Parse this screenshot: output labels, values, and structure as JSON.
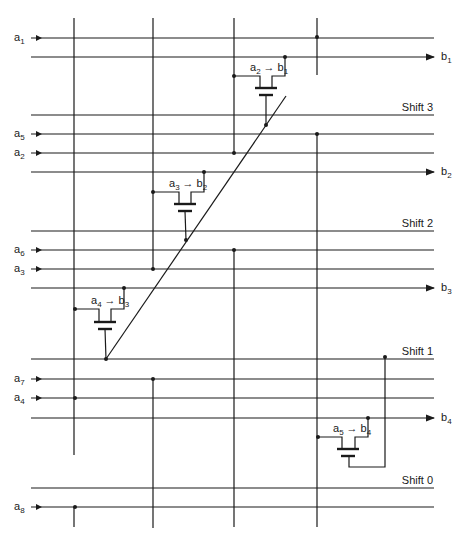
{
  "diagram": {
    "type": "barrel-shifter-crossbar",
    "inputs": [
      {
        "name": "a",
        "sub": "1",
        "y": 38
      },
      {
        "name": "a",
        "sub": "5",
        "y": 134
      },
      {
        "name": "a",
        "sub": "2",
        "y": 153
      },
      {
        "name": "a",
        "sub": "6",
        "y": 250
      },
      {
        "name": "a",
        "sub": "3",
        "y": 269
      },
      {
        "name": "a",
        "sub": "7",
        "y": 379
      },
      {
        "name": "a",
        "sub": "4",
        "y": 398
      },
      {
        "name": "a",
        "sub": "8",
        "y": 507
      }
    ],
    "outputs": [
      {
        "name": "b",
        "sub": "1",
        "y": 57
      },
      {
        "name": "b",
        "sub": "2",
        "y": 172
      },
      {
        "name": "b",
        "sub": "3",
        "y": 288
      },
      {
        "name": "b",
        "sub": "4",
        "y": 418
      }
    ],
    "shift_lines": [
      {
        "label": "Shift 3",
        "y": 115
      },
      {
        "label": "Shift 2",
        "y": 231
      },
      {
        "label": "Shift 1",
        "y": 359
      },
      {
        "label": "Shift 0",
        "y": 488
      }
    ],
    "transistors": [
      {
        "label_a": "a",
        "sub_a": "2",
        "arrow": "→",
        "label_b": "b",
        "sub_b": "1"
      },
      {
        "label_a": "a",
        "sub_a": "3",
        "arrow": "→",
        "label_b": "b",
        "sub_b": "2"
      },
      {
        "label_a": "a",
        "sub_a": "4",
        "arrow": "→",
        "label_b": "b",
        "sub_b": "3"
      },
      {
        "label_a": "a",
        "sub_a": "5",
        "arrow": "→",
        "label_b": "b",
        "sub_b": "4"
      }
    ],
    "colors": {
      "ink": "#1a1a1a",
      "background": "#ffffff"
    }
  }
}
